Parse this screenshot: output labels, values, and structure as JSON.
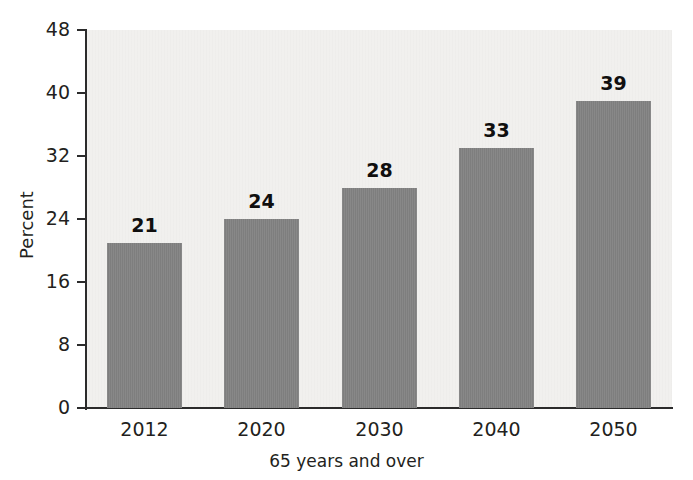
{
  "chart_data": {
    "type": "bar",
    "title": "",
    "subtitle": "",
    "xlabel": "65 years and over",
    "ylabel": "Percent",
    "categories": [
      "2012",
      "2020",
      "2030",
      "2040",
      "2050"
    ],
    "values": [
      21,
      24,
      28,
      33,
      39
    ],
    "data_labels": [
      "21",
      "24",
      "28",
      "33",
      "39"
    ],
    "ylim": [
      0,
      48
    ],
    "yticks": [
      0,
      8,
      16,
      24,
      32,
      40,
      48
    ],
    "ytick_labels": [
      "0",
      "8",
      "16",
      "24",
      "32",
      "40",
      "48"
    ],
    "grid": false,
    "legend": null,
    "bar_color": "#828282",
    "plot_background": "#f1f0ee",
    "axis_color": "#2b2b2b",
    "text_color": "#231f20"
  },
  "axes": {
    "y_title": "Percent",
    "x_title": "65 years and over"
  },
  "bars": [
    {
      "label": "2012",
      "value": 21,
      "value_text": "21"
    },
    {
      "label": "2020",
      "value": 24,
      "value_text": "24"
    },
    {
      "label": "2030",
      "value": 28,
      "value_text": "28"
    },
    {
      "label": "2040",
      "value": 33,
      "value_text": "33"
    },
    {
      "label": "2050",
      "value": 39,
      "value_text": "39"
    }
  ],
  "yticks": [
    {
      "label": "48",
      "value": 48
    },
    {
      "label": "40",
      "value": 40
    },
    {
      "label": "32",
      "value": 32
    },
    {
      "label": "24",
      "value": 24
    },
    {
      "label": "16",
      "value": 16
    },
    {
      "label": "8",
      "value": 8
    },
    {
      "label": "0",
      "value": 0
    }
  ]
}
